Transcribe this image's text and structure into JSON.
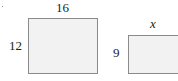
{
  "figure": {
    "left_rectangle": {
      "top_label": "16",
      "side_label": "12"
    },
    "right_rectangle": {
      "top_label": "x",
      "side_label": "9"
    }
  }
}
